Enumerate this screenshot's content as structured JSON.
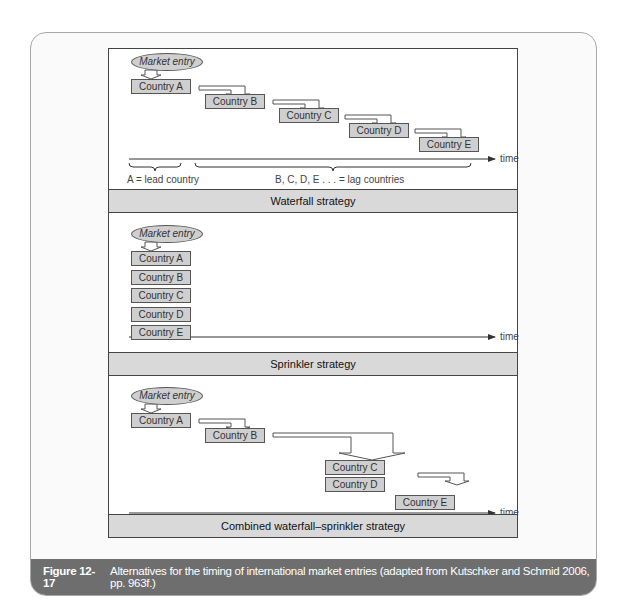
{
  "figure": {
    "number": "Figure 12-17",
    "caption": "Alternatives for the timing of international market entries (adapted from Kutschker and Schmid 2006, pp. 963f.)"
  },
  "panels": {
    "waterfall": {
      "title": "Waterfall strategy",
      "start": "Market entry",
      "countries": [
        "Country A",
        "Country B",
        "Country C",
        "Country D",
        "Country E"
      ],
      "axis_label": "time",
      "lead_label": "A = lead country",
      "lag_label": "B, C, D, E . . . = lag countries"
    },
    "sprinkler": {
      "title": "Sprinkler strategy",
      "start": "Market entry",
      "countries": [
        "Country A",
        "Country B",
        "Country C",
        "Country D",
        "Country E"
      ],
      "axis_label": "time"
    },
    "combined": {
      "title": "Combined waterfall–sprinkler strategy",
      "start": "Market entry",
      "countries": [
        "Country A",
        "Country B",
        "Country C",
        "Country D",
        "Country E"
      ],
      "axis_label": "time"
    }
  }
}
